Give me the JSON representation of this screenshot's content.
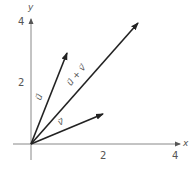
{
  "axes": {
    "x_label": "x",
    "y_label": "y",
    "x_ticks": [
      "2",
      "4"
    ],
    "y_ticks": [
      "2",
      "4"
    ]
  },
  "vectors": [
    {
      "name": "u",
      "label": "u⃗",
      "x": 1,
      "y": 3
    },
    {
      "name": "v",
      "label": "v⃗",
      "x": 2,
      "y": 1
    },
    {
      "name": "u+v",
      "label": "u⃗ + v⃗",
      "x": 3,
      "y": 4
    }
  ]
}
